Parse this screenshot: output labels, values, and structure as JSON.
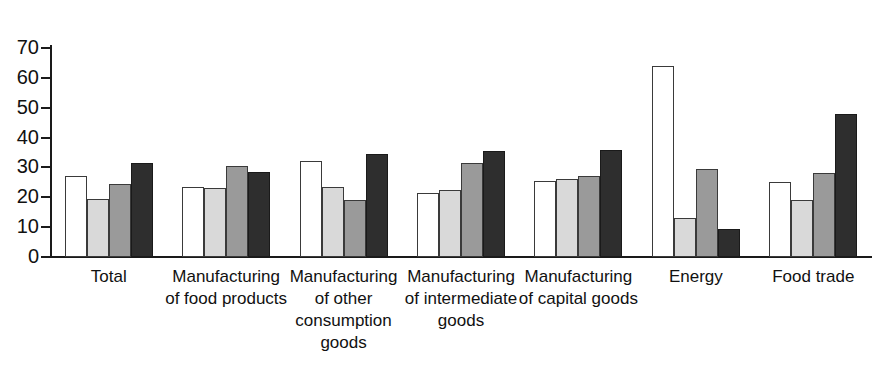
{
  "chart_data": {
    "type": "bar",
    "title": "",
    "subtitle": "",
    "xlabel": "",
    "ylabel": "",
    "ylim": [
      0,
      70
    ],
    "ytick_labels": [
      "70",
      "60",
      "50",
      "40",
      "30",
      "20",
      "10",
      "0"
    ],
    "yticks": [
      70,
      60,
      50,
      40,
      30,
      20,
      10,
      0
    ],
    "grid": false,
    "legend": "none",
    "legend_entries": [],
    "categories": [
      "Total",
      "Manufacturing\nof food products",
      "Manufacturing\nof other\nconsumption\ngoods",
      "Manufacturing\nof intermediate\ngoods",
      "Manufacturing\nof capital goods",
      "Energy",
      "Food trade"
    ],
    "series": [
      {
        "name": "series-1",
        "color": "#ffffff",
        "values": [
          27,
          23.5,
          32,
          21.5,
          25.5,
          64,
          25
        ]
      },
      {
        "name": "series-2",
        "color": "#d9d9d9",
        "values": [
          19.5,
          23,
          23.5,
          22.5,
          26,
          13,
          19
        ]
      },
      {
        "name": "series-3",
        "color": "#9a9a9a",
        "values": [
          24.5,
          30.5,
          19,
          31.5,
          27,
          29.5,
          28
        ]
      },
      {
        "name": "series-4",
        "color": "#2e2e2e",
        "values": [
          31.5,
          28.5,
          34.5,
          35.5,
          36,
          9.5,
          48
        ]
      }
    ]
  }
}
